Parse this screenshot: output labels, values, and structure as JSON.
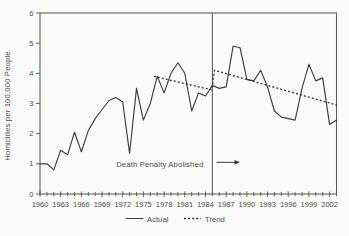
{
  "page": {
    "background": "#fbfbf9"
  },
  "chart_data": {
    "type": "line",
    "title": "",
    "xlabel": "",
    "ylabel": "Homicides per 100,000 People",
    "xlim": [
      1960,
      2003
    ],
    "ylim": [
      0,
      6
    ],
    "grid": false,
    "legend_position": "bottom-center",
    "yticks": [
      0,
      1,
      2,
      3,
      4,
      5,
      6
    ],
    "xticks": [
      1960,
      1963,
      1966,
      1969,
      1972,
      1975,
      1978,
      1981,
      1984,
      1987,
      1990,
      1993,
      1996,
      1999,
      2002
    ],
    "minor_xtick_every_years": 1,
    "series": [
      {
        "name": "Actual",
        "style": "solid",
        "x_start": 1960,
        "x_step": 1,
        "values": [
          1.0,
          1.0,
          0.8,
          1.45,
          1.3,
          2.05,
          1.4,
          2.1,
          2.5,
          2.8,
          3.1,
          3.2,
          3.05,
          1.35,
          3.5,
          2.45,
          3.0,
          3.9,
          3.35,
          4.0,
          4.35,
          4.0,
          2.75,
          3.35,
          3.25,
          3.6,
          3.5,
          3.55,
          4.9,
          4.85,
          3.8,
          3.75,
          4.1,
          3.55,
          2.75,
          2.55,
          2.5,
          2.45,
          3.5,
          4.3,
          3.75,
          3.85,
          2.3,
          2.45
        ]
      },
      {
        "name": "Trend",
        "style": "dotted",
        "points": [
          [
            1976.5,
            3.9
          ],
          [
            1984.9,
            3.45
          ],
          [
            1985.3,
            4.1
          ],
          [
            2003,
            2.95
          ]
        ]
      }
    ],
    "vline": {
      "x": 1985,
      "label": "Death Penalty Abolished"
    },
    "annotation": {
      "text": "Death Penalty Abolished",
      "text_end_x": 1983.7,
      "text_y": 0.97,
      "arrow": {
        "from_x": 1985.6,
        "to_x": 1989.0,
        "y": 1.05
      }
    },
    "legend": {
      "entries": [
        "Actual",
        "Trend"
      ]
    }
  }
}
